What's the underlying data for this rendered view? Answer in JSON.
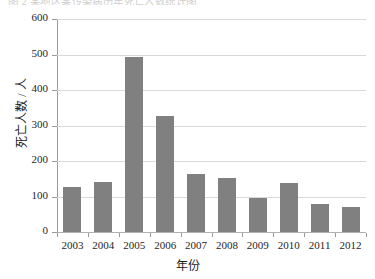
{
  "caption": {
    "text": "图 2  某地区某传染病历年死亡人数统计图"
  },
  "chart_data": {
    "type": "bar",
    "title": "",
    "xlabel": "年份",
    "ylabel": "死亡人数 / 人",
    "categories": [
      "2003",
      "2004",
      "2005",
      "2006",
      "2007",
      "2008",
      "2009",
      "2010",
      "2011",
      "2012"
    ],
    "values": [
      128,
      142,
      492,
      327,
      163,
      152,
      97,
      138,
      78,
      70
    ],
    "series": [
      {
        "name": "死亡人数",
        "values": [
          128,
          142,
          492,
          327,
          163,
          152,
          97,
          138,
          78,
          70
        ]
      }
    ],
    "ylim": [
      0,
      600
    ],
    "ytick_values": [
      0,
      100,
      200,
      300,
      400,
      500,
      600
    ],
    "ytick_labels": [
      "0",
      "100",
      "200",
      "300",
      "400",
      "500",
      "600"
    ],
    "grid": true,
    "grid_axis": "y",
    "legend": false,
    "legend_position": "none",
    "bar_color": "#808080",
    "grid_color": "#d9d9d9",
    "axis_color": "#9a9a9a",
    "background": "#ffffff"
  }
}
